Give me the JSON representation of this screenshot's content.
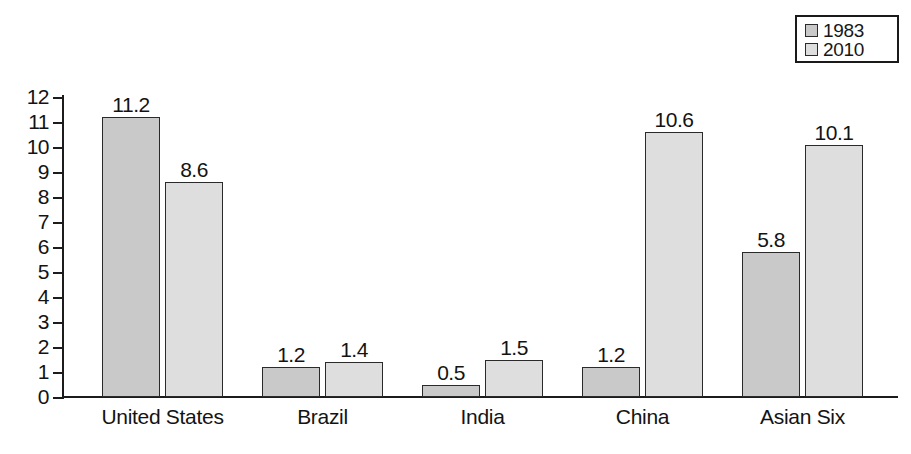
{
  "chart_data": {
    "type": "bar",
    "title": "",
    "subtitle": "",
    "xlabel": "",
    "ylabel": "",
    "categories": [
      "United States",
      "Brazil",
      "India",
      "China",
      "Asian Six"
    ],
    "series": [
      {
        "name": "1983",
        "color": "#c9c9c9",
        "values": [
          11.2,
          1.2,
          0.5,
          1.2,
          5.8
        ]
      },
      {
        "name": "2010",
        "color": "#dedede",
        "values": [
          8.6,
          1.4,
          1.5,
          10.6,
          10.1
        ]
      }
    ],
    "value_labels": [
      [
        "11.2",
        "8.6"
      ],
      [
        "1.2",
        "1.4"
      ],
      [
        "0.5",
        "1.5"
      ],
      [
        "1.2",
        "10.6"
      ],
      [
        "5.8",
        "10.1"
      ]
    ],
    "ylim": [
      0,
      12
    ],
    "ytick_labels": [
      "12",
      "11",
      "10",
      "9",
      "8",
      "7",
      "6",
      "5",
      "4",
      "3",
      "2",
      "1",
      "0"
    ],
    "ytick_values": [
      12,
      11,
      10,
      9,
      8,
      7,
      6,
      5,
      4,
      3,
      2,
      1,
      0
    ],
    "grid": false,
    "legend_position": "top-right",
    "legend_entries": [
      "1983",
      "2010"
    ],
    "axis_color": "#1c1c1c",
    "bar_border_color": "#2a2a2a",
    "background": "#ffffff"
  }
}
